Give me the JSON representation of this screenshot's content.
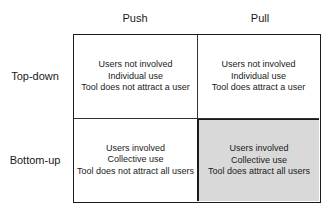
{
  "columns": [
    {
      "label": "Push"
    },
    {
      "label": "Pull"
    }
  ],
  "rows": [
    {
      "label": "Top-down"
    },
    {
      "label": "Bottom-up"
    }
  ],
  "cells": {
    "top_push": {
      "lines": [
        "Users not involved",
        "Individual use",
        "Tool does not attract a user"
      ],
      "shaded": false
    },
    "top_pull": {
      "lines": [
        "Users not involved",
        "Individual use",
        "Tool does attract a user"
      ],
      "shaded": false
    },
    "bottom_push": {
      "lines": [
        "Users involved",
        "Collective use",
        "Tool does not attract all users"
      ],
      "shaded": false
    },
    "bottom_pull": {
      "lines": [
        "Users involved",
        "Collective use",
        "Tool does attract all users"
      ],
      "shaded": true
    }
  },
  "colors": {
    "border": "#1a1a1a",
    "shaded_fill": "#d9d9d9",
    "background": "#ffffff"
  }
}
